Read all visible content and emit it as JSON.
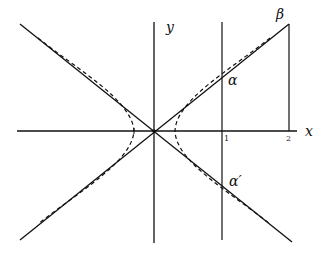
{
  "diagram": {
    "type": "hyperbola-with-asymptotes",
    "axes": {
      "x_label": "x",
      "y_label": "y"
    },
    "ticks": {
      "x1": "1",
      "x2": "2"
    },
    "points": {
      "beta": "β",
      "alpha": "α",
      "alpha_prime": "α′"
    },
    "elements": [
      "x-axis",
      "y-axis",
      "asymptote y=+kx (solid)",
      "asymptote y=-kx (solid)",
      "hyperbola right branch (dashed)",
      "hyperbola left branch (dashed)",
      "vertical line x=1",
      "vertical segment x=2 from axis to beta"
    ],
    "colors": {
      "stroke": "#111111",
      "background": "#ffffff"
    }
  }
}
